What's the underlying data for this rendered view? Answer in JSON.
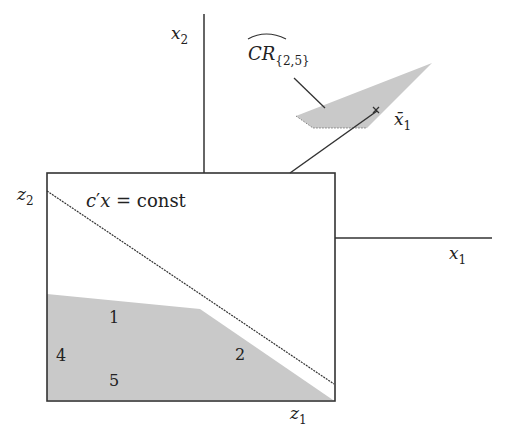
{
  "diagram": {
    "axes": {
      "x1_label": "x",
      "x1_sub": "1",
      "x2_label": "x",
      "x2_sub": "2"
    },
    "box": {
      "z1_label": "z",
      "z1_sub": "1",
      "z2_label": "z",
      "z2_sub": "2",
      "line_label_c": "c",
      "line_label_prime": "′",
      "line_label_x": "x",
      "line_label_eq": " = const"
    },
    "regions": [
      {
        "label": "1"
      },
      {
        "label": "2"
      },
      {
        "label": "4"
      },
      {
        "label": "5"
      }
    ],
    "critical_region": {
      "label": "CR",
      "sub": "{2,5}"
    },
    "point": {
      "label": "x̄",
      "sub": "1"
    },
    "colors": {
      "fill": "#c9c9c9",
      "line": "#222222"
    }
  }
}
